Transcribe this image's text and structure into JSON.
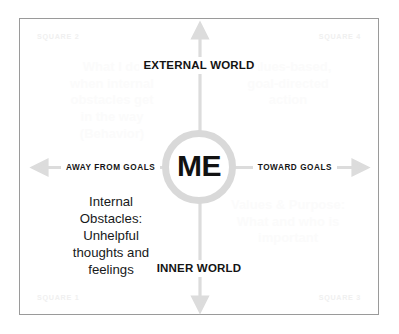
{
  "diagram": {
    "center": {
      "label": "ME"
    },
    "axes": {
      "vertical": {
        "top_label": "EXTERNAL\nWORLD",
        "bottom_label": "INNER\nWORLD"
      },
      "horizontal": {
        "left_label": "AWAY FROM GOALS",
        "right_label": "TOWARD GOALS"
      }
    },
    "corner_labels": {
      "top_left": "SQUARE 2",
      "top_right": "SQUARE 4",
      "bottom_left": "SQUARE 1",
      "bottom_right": "SQUARE 3"
    },
    "quadrants": {
      "top_left": "What I do\nwhen internal\nobstacles get\nin the way\n(Behavior)",
      "top_right": "Values-based,\ngoal-directed\naction",
      "bottom_left": "Internal\nObstacles:\nUnhelpful\nthoughts and\nfeelings",
      "bottom_right": "Values & Purpose:\nWhat and who is\nimportant"
    },
    "colors": {
      "frame_border": "#9a9a9a",
      "axis_gray": "#dcdcdc",
      "ring_gray": "#d9d9d9",
      "text_dark": "#17191a",
      "text_faint": "#fbfbfb",
      "corner_faint": "#f0f0f0",
      "background": "#ffffff"
    }
  }
}
